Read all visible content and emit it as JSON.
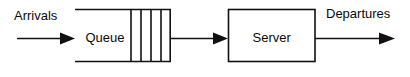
{
  "diagram": {
    "background_color": "#ffffff",
    "stroke_color": "#111111",
    "text_color": "#0a0a0a",
    "labels": {
      "arrivals": "Arrivals",
      "departures": "Departures",
      "queue": "Queue",
      "server": "Server"
    },
    "nodes": [
      {
        "id": "queue",
        "label": "Queue",
        "shape": "open-left-rectangle",
        "x": 75,
        "y": 9,
        "width": 96,
        "height": 52,
        "slot_dividers": 4
      },
      {
        "id": "server",
        "label": "Server",
        "shape": "rectangle",
        "x": 228,
        "y": 9,
        "width": 87,
        "height": 52
      }
    ],
    "arrows": [
      {
        "id": "arrivals-arrow",
        "label": "Arrivals",
        "from": "outside-left",
        "to": "queue",
        "x1": 17,
        "x2": 73,
        "y": 38
      },
      {
        "id": "queue-to-server-arrow",
        "label": "",
        "from": "queue",
        "to": "server",
        "x1": 171,
        "x2": 227,
        "y": 38
      },
      {
        "id": "departures-arrow",
        "label": "Departures",
        "from": "server",
        "to": "outside-right",
        "x1": 315,
        "x2": 395,
        "y": 38
      }
    ]
  }
}
